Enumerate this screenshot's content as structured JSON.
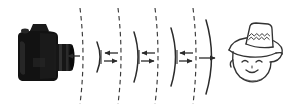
{
  "figure": {
    "title": "Camera to subject wavefront propagation diagram",
    "background_color": "#ffffff",
    "ink_color": "#2b2b2b",
    "camera_color": "#111111",
    "width": 290,
    "height": 110
  },
  "elements": {
    "camera": {
      "name": "dslr-camera",
      "label": "Black DSLR camera facing right",
      "x": 12,
      "y": 27,
      "width": 56,
      "height": 56
    },
    "face": {
      "name": "smiling-face-with-hat",
      "label": "Line-drawn smiling face wearing a wide brimmed hat",
      "x": 216,
      "y": 22,
      "width": 68,
      "height": 66,
      "features": {
        "hat_band_pattern": "zigzag",
        "eyes": "closed-curved",
        "mouth": "smile"
      }
    },
    "dashed_planes": [
      {
        "name": "dashed-plane-1",
        "x": 82,
        "curve": 6
      },
      {
        "name": "dashed-plane-2",
        "x": 120,
        "curve": 6
      },
      {
        "name": "dashed-plane-3",
        "x": 157,
        "curve": 6
      },
      {
        "name": "dashed-plane-4",
        "x": 195,
        "curve": 6
      }
    ],
    "solid_arcs": [
      {
        "name": "solid-arc-1",
        "x": 99,
        "curve": 7
      },
      {
        "name": "solid-arc-2",
        "x": 137,
        "curve": 7
      },
      {
        "name": "solid-arc-3",
        "x": 174,
        "curve": 7
      },
      {
        "name": "solid-arc-4",
        "x": 212,
        "curve": 9
      }
    ],
    "arrows": [
      {
        "name": "arrow-to-camera",
        "direction": "left",
        "x_start": 80,
        "x_end": 66,
        "y": 56
      },
      {
        "name": "arrow-pair-1-left",
        "direction": "left",
        "x_start": 118,
        "x_end": 104,
        "y": 53
      },
      {
        "name": "arrow-pair-1-right",
        "direction": "right",
        "x_start": 104,
        "x_end": 118,
        "y": 61
      },
      {
        "name": "arrow-pair-2-left",
        "direction": "left",
        "x_start": 155,
        "x_end": 141,
        "y": 53
      },
      {
        "name": "arrow-pair-2-right",
        "direction": "right",
        "x_start": 141,
        "x_end": 155,
        "y": 61
      },
      {
        "name": "arrow-pair-3-left",
        "direction": "left",
        "x_start": 193,
        "x_end": 179,
        "y": 53
      },
      {
        "name": "arrow-pair-3-right",
        "direction": "right",
        "x_start": 179,
        "x_end": 193,
        "y": 61
      },
      {
        "name": "arrow-to-face",
        "direction": "right",
        "x_start": 200,
        "x_end": 216,
        "y": 58
      }
    ]
  }
}
